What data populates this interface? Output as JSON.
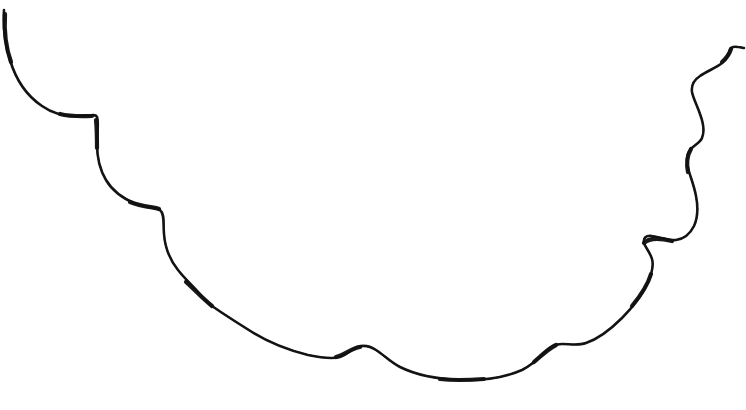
{
  "canvas": {
    "width": 746,
    "height": 410,
    "background_color": "#ffffff",
    "title": "hand-drawn scalloped curve sketch"
  },
  "drawing": {
    "kind": "freehand-line-drawing",
    "stroke_color": "#121212",
    "stroke_count": 1,
    "description": "single continuous hand-drawn wavy line forming a wide downward arc with scalloped bumps, entering at the top-left edge and exiting at the top-right edge",
    "endpoints": {
      "start": "top-left edge near (4, 10)",
      "end": "right edge near (744, 48)"
    },
    "extreme_points": {
      "lowest_y": 380,
      "lowest_x": 470,
      "highest_y": 10
    },
    "main_path": "M 4 10 C 3 26 5 44 10 60 C 16 80 27 96 42 106 C 56 116 72 117 84 116 C 92 115 96 114 97 117 C 99 123 97 134 97 144 C 97 158 100 170 106 180 C 113 192 124 199 136 204 C 147 208 156 207 160 210 C 165 214 163 224 164 234 C 165 248 170 260 178 270 C 185 279 193 286 198 292 C 203 298 206 302 212 306 C 222 313 236 322 252 332 C 268 342 288 350 308 355 C 322 358 333 359 340 357 C 348 354 352 349 357 347 C 363 345 370 346 376 350 C 384 355 390 362 400 367 C 414 374 436 379 460 380 C 484 381 506 377 522 370 C 534 364 541 356 546 351 C 551 346 556 344 562 344 C 570 344 578 346 586 343 C 598 339 610 330 622 318 C 634 306 643 293 648 282 C 652 273 654 266 652 259 C 650 252 645 247 644 243 C 643 238 646 235 652 236 C 660 237 668 241 676 240 C 684 239 690 234 694 226 C 698 217 698 206 696 196 C 694 185 690 176 688 168 C 686 160 687 154 690 150 C 694 145 700 143 702 138 C 705 131 703 122 700 114 C 697 105 693 98 692 92 C 691 85 694 80 700 76 C 707 71 716 68 722 63 C 727 59 729 54 730 50 C 731 47 733 46 738 47 C 741 47 743 48 744 48",
    "emphasis_segments": [
      "M 5 14 C 4 30 6 48 11 62",
      "M 60 114 C 72 117 84 116 92 116",
      "M 96 120 C 97 130 97 140 97 148",
      "M 130 202 C 143 207 154 207 159 209",
      "M 186 282 C 195 290 202 298 212 306",
      "M 336 357 C 346 354 352 348 360 347",
      "M 440 379 C 456 381 470 380 484 379",
      "M 534 362 C 542 355 548 349 556 345",
      "M 632 306 C 642 294 648 284 651 274",
      "M 644 243 C 650 237 660 238 672 241",
      "M 688 172 C 686 162 688 154 691 149",
      "M 722 62 C 728 57 730 52 731 49"
    ]
  }
}
